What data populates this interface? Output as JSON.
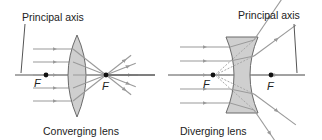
{
  "colors": {
    "background": "#ffffff",
    "axis": "#555555",
    "ray": "#9a9a9a",
    "lens_fill": "#cfcfcf",
    "lens_stroke": "#6a6a6a",
    "dashed_ray": "#a8a8a8",
    "focal_dot": "#111111",
    "text": "#222222"
  },
  "converging": {
    "caption": "Converging lens",
    "axis_label": "Principal axis",
    "focal_left_label": "F",
    "focal_right_label": "F",
    "axis_y": 75,
    "axis_x": [
      15,
      155
    ],
    "lens_center_x": 77,
    "lens_top_y": 35,
    "lens_bottom_y": 117,
    "lens_half_width": 9,
    "focal_left_x": 46,
    "focal_right_x": 106,
    "ray_start_x": 33,
    "ray_ys": [
      49,
      62,
      75,
      88,
      101
    ]
  },
  "diverging": {
    "caption": "Diverging lens",
    "axis_label": "Principal axis",
    "focal_left_label": "F",
    "focal_right_label": "F",
    "axis_y": 75,
    "axis_x": [
      168,
      305
    ],
    "lens_left_x": 226,
    "lens_right_x": 258,
    "lens_top_y": 37,
    "lens_bottom_y": 113,
    "lens_waist_inset": 8,
    "focal_left_x": 213,
    "focal_right_x": 271,
    "ray_start_x": 180,
    "ray_ys": [
      47,
      61,
      75,
      89,
      103
    ]
  }
}
